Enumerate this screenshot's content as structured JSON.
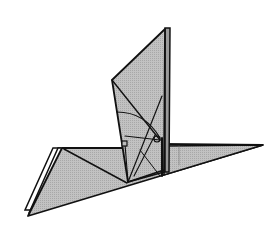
{
  "diagram": {
    "colors": {
      "background": "#ffffff",
      "paper_fill": "#b9b9b9",
      "paper_fill_light": "#c6c6c6",
      "outline": "#111111"
    }
  }
}
